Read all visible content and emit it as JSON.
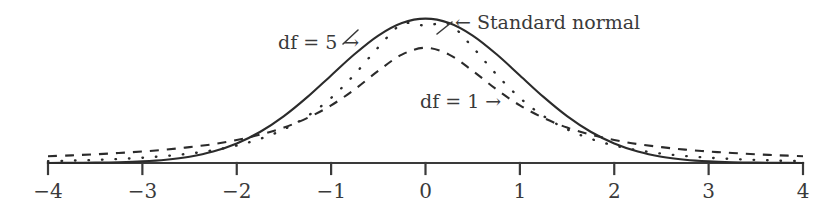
{
  "chart_data": {
    "type": "line",
    "title": "",
    "subtitle": "",
    "xlabel": "",
    "ylabel": "",
    "xlim": [
      -4,
      4
    ],
    "ylim": [
      0,
      0.42
    ],
    "grid": false,
    "legend_position": "inline-annotations",
    "x_ticks": [
      -4,
      -3,
      -2,
      -1,
      0,
      1,
      2,
      3,
      4
    ],
    "x_tick_labels": [
      "−4",
      "−3",
      "−2",
      "−1",
      "0",
      "1",
      "2",
      "3",
      "4"
    ],
    "y_ticks": [],
    "y_tick_labels": [],
    "axis_style": "single-horizontal-axis-with-downward-ticks",
    "series": [
      {
        "name": "Standard normal",
        "style": "solid",
        "peak_x": 0,
        "peak_y": 0.3989,
        "x": [
          -4,
          -3.75,
          -3.5,
          -3.25,
          -3,
          -2.75,
          -2.5,
          -2.25,
          -2,
          -1.75,
          -1.5,
          -1.25,
          -1,
          -0.75,
          -0.5,
          -0.25,
          0,
          0.25,
          0.5,
          0.75,
          1,
          1.25,
          1.5,
          1.75,
          2,
          2.25,
          2.5,
          2.75,
          3,
          3.25,
          3.5,
          3.75,
          4
        ],
        "values": [
          0.0001,
          0.0004,
          0.0009,
          0.002,
          0.0044,
          0.0091,
          0.0175,
          0.0317,
          0.054,
          0.0863,
          0.1295,
          0.1826,
          0.242,
          0.3011,
          0.3521,
          0.3867,
          0.3989,
          0.3867,
          0.3521,
          0.3011,
          0.242,
          0.1826,
          0.1295,
          0.0863,
          0.054,
          0.0317,
          0.0175,
          0.0091,
          0.0044,
          0.002,
          0.0009,
          0.0004,
          0.0001
        ]
      },
      {
        "name": "df = 5",
        "style": "dotted",
        "df": 5,
        "peak_x": 0,
        "peak_y": 0.3796,
        "x": [
          -4,
          -3.75,
          -3.5,
          -3.25,
          -3,
          -2.75,
          -2.5,
          -2.25,
          -2,
          -1.75,
          -1.5,
          -1.25,
          -1,
          -0.75,
          -0.5,
          -0.25,
          0,
          0.25,
          0.5,
          0.75,
          1,
          1.25,
          1.5,
          1.75,
          2,
          2.25,
          2.5,
          2.75,
          3,
          3.25,
          3.5,
          3.75,
          4
        ],
        "values": [
          0.0051,
          0.0065,
          0.0085,
          0.0111,
          0.0146,
          0.0194,
          0.026,
          0.0352,
          0.0484,
          0.0669,
          0.0931,
          0.1297,
          0.1799,
          0.2452,
          0.3197,
          0.3836,
          0.3796,
          0.3836,
          0.3197,
          0.2452,
          0.1799,
          0.1297,
          0.0931,
          0.0669,
          0.0484,
          0.0352,
          0.026,
          0.0194,
          0.0146,
          0.0111,
          0.0085,
          0.0065,
          0.0051
        ]
      },
      {
        "name": "df = 1",
        "style": "dashed",
        "df": 1,
        "peak_x": 0,
        "peak_y": 0.3183,
        "x": [
          -4,
          -3.75,
          -3.5,
          -3.25,
          -3,
          -2.75,
          -2.5,
          -2.25,
          -2,
          -1.75,
          -1.5,
          -1.25,
          -1,
          -0.75,
          -0.5,
          -0.25,
          0,
          0.25,
          0.5,
          0.75,
          1,
          1.25,
          1.5,
          1.75,
          2,
          2.25,
          2.5,
          2.75,
          3,
          3.25,
          3.5,
          3.75,
          4
        ],
        "values": [
          0.0187,
          0.0212,
          0.0241,
          0.0277,
          0.0318,
          0.0369,
          0.0439,
          0.0521,
          0.0637,
          0.0785,
          0.0979,
          0.1246,
          0.1592,
          0.2037,
          0.2546,
          0.2996,
          0.3183,
          0.2996,
          0.2546,
          0.2037,
          0.1592,
          0.1246,
          0.0979,
          0.0785,
          0.0637,
          0.0521,
          0.0439,
          0.0369,
          0.0318,
          0.0277,
          0.0241,
          0.0212,
          0.0187
        ]
      }
    ],
    "annotations": [
      {
        "name": "standard-normal",
        "text": "← Standard normal",
        "label": "Standard normal",
        "arrow": "←",
        "points_to": "solid curve"
      },
      {
        "name": "df-5",
        "text": "df = 5 →",
        "label": "df = 5",
        "arrow": "→",
        "points_to": "dotted curve"
      },
      {
        "name": "df-1",
        "text": "df = 1 →",
        "label": "df = 1",
        "arrow": "→",
        "points_to": "dashed curve"
      }
    ],
    "colors": {
      "background": "#ffffff",
      "line": "#2b2b2b",
      "axis": "#3a3a3a",
      "text": "#3a3a3a"
    }
  }
}
